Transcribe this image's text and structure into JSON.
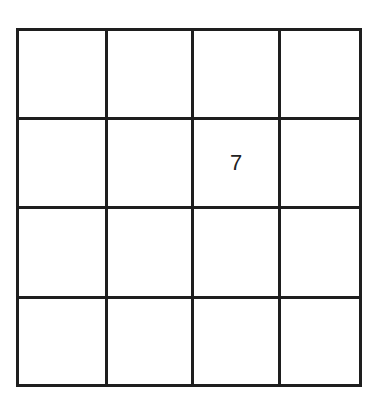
{
  "diagram": {
    "type": "grid",
    "rows": 4,
    "columns": 4,
    "line_color": "#1e1e1e",
    "text_color": "#222222",
    "cells": [
      [
        "",
        "",
        "",
        ""
      ],
      [
        "",
        "",
        "7",
        ""
      ],
      [
        "",
        "",
        "",
        ""
      ],
      [
        "",
        "",
        "",
        ""
      ]
    ]
  }
}
